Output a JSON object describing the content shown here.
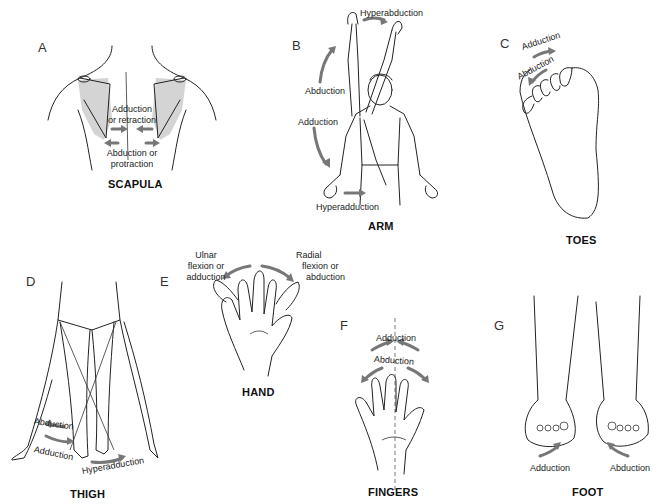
{
  "figure": {
    "panels": [
      {
        "id": "A",
        "letter": "A",
        "caption": "SCAPULA",
        "labels": {
          "adduction_1": "Adduction",
          "adduction_2": "or retraction",
          "abduction_1": "Abduction or",
          "abduction_2": "protraction"
        }
      },
      {
        "id": "B",
        "letter": "B",
        "caption": "ARM",
        "labels": {
          "hyperabduction": "Hyperabduction",
          "abduction": "Abduction",
          "adduction": "Adduction",
          "hyperadduction": "Hyperadduction"
        }
      },
      {
        "id": "C",
        "letter": "C",
        "caption": "TOES",
        "labels": {
          "adduction": "Adduction",
          "abduction": "Abduction"
        }
      },
      {
        "id": "D",
        "letter": "D",
        "caption": "THIGH",
        "labels": {
          "abduction": "Abduction",
          "adduction": "Adduction",
          "hyperadduction": "Hyperadduction"
        }
      },
      {
        "id": "E",
        "letter": "E",
        "caption": "HAND",
        "labels": {
          "ulnar_1": "Ulnar",
          "ulnar_2": "flexion or",
          "ulnar_3": "adduction",
          "radial_1": "Radial",
          "radial_2": "flexion or",
          "radial_3": "abduction"
        }
      },
      {
        "id": "F",
        "letter": "F",
        "caption": "FINGERS",
        "labels": {
          "adduction": "Adduction",
          "abduction": "Abduction"
        }
      },
      {
        "id": "G",
        "letter": "G",
        "caption": "FOOT",
        "labels": {
          "adduction": "Adduction",
          "abduction": "Abduction"
        }
      }
    ],
    "colors": {
      "arrow": "#777777",
      "shading": "#d4d4d4",
      "line": "#222222"
    }
  }
}
